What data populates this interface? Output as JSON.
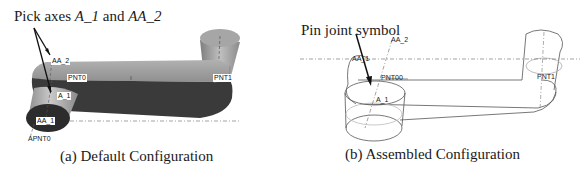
{
  "figure": {
    "panels": [
      {
        "id": "a",
        "caption": "(a) Default Configuration",
        "callout": {
          "prefix": "Pick axes ",
          "axis1": "A_1",
          "middle": " and ",
          "axis2": "AA_2"
        },
        "labels": {
          "aa2": "AA_2",
          "pnt0": "PNT0",
          "pnt1": "PNT1",
          "a1": "A_1",
          "aa1": "AA_1",
          "apnt0": "APNT0"
        },
        "colors": {
          "body_top": "#a3a3a3",
          "body_side": "#3c3c3c",
          "cylinder_side": "#b5b5b5",
          "cylinder_top": "#2e2e2e"
        }
      },
      {
        "id": "b",
        "caption": "(b) Assembled Configuration",
        "callout": {
          "text": "Pin joint symbol"
        },
        "labels": {
          "aa2": "AA_2",
          "aa1": "AA_1",
          "pnt00": "PNT00",
          "pnt1": "PNT1",
          "a1": "A_1"
        },
        "colors": {
          "outline": "#555555"
        }
      }
    ]
  }
}
